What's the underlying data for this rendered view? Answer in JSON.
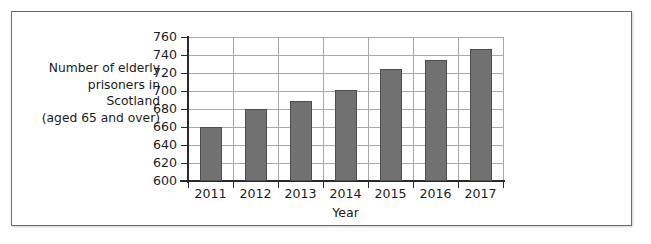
{
  "chart_data": {
    "type": "bar",
    "title": "",
    "categories": [
      "2011",
      "2012",
      "2013",
      "2014",
      "2015",
      "2016",
      "2017"
    ],
    "values": [
      660,
      680,
      689,
      701,
      724,
      735,
      747
    ],
    "series": [
      {
        "name": "Number of elderly prisoners in Scotland (aged 65 and over)",
        "values": [
          660,
          680,
          689,
          701,
          724,
          735,
          747
        ]
      }
    ],
    "xlabel": "Year",
    "ylabel": "Number of elderly prisoners in Scotland (aged 65 and over)",
    "ylabel_lines": [
      "Number of elderly",
      "prisoners in",
      "Scotland",
      "(aged 65 and over)"
    ],
    "ylim": [
      600,
      760
    ],
    "ytick_values": [
      600,
      620,
      640,
      660,
      680,
      700,
      720,
      740,
      760
    ],
    "ytick_labels": [
      "600",
      "620",
      "640",
      "660",
      "680",
      "700",
      "720",
      "740",
      "760"
    ],
    "ytick_interval": 20,
    "xtick_labels": [
      "2011",
      "2012",
      "2013",
      "2014",
      "2015",
      "2016",
      "2017"
    ],
    "grid": true,
    "grid_axis": "both",
    "legend": false,
    "legend_position": "none",
    "bar_color": "#717171",
    "bar_edge_color": "#4d4d4d",
    "grid_color": "#a8a8a8",
    "axis_color": "#2a2a2a",
    "background_color": "#ffffff",
    "frame_border_color": "#6b6b6b"
  }
}
